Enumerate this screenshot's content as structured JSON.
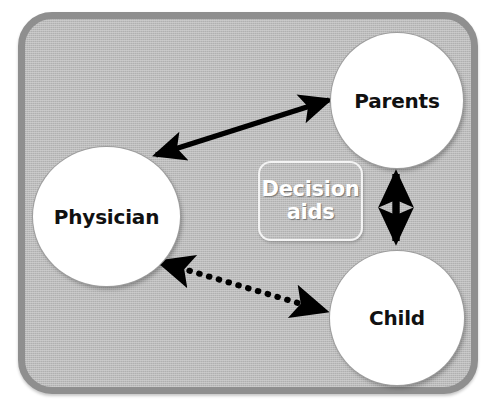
{
  "diagram": {
    "background_color": "#b6b6b6",
    "frame_border_color": "#8f8f8f",
    "node_fill_color": "#ffffff",
    "arrow_color": "#000000",
    "callout_text_color": "#ffffff",
    "scan_artifact_text": "",
    "nodes": [
      {
        "id": "physician",
        "label": "Physician"
      },
      {
        "id": "parents",
        "label": "Parents"
      },
      {
        "id": "child",
        "label": "Child"
      }
    ],
    "callout": {
      "id": "decision-aids",
      "line1": "Decision",
      "line2": "aids"
    },
    "connections": [
      {
        "id": "physician-parents",
        "from": "Physician",
        "to": "Parents",
        "style": "solid",
        "arrowheads": "both"
      },
      {
        "id": "parents-child",
        "from": "Parents",
        "to": "Child",
        "style": "solid",
        "arrowheads": "both"
      },
      {
        "id": "physician-child",
        "from": "Physician",
        "to": "Child",
        "style": "dotted",
        "arrowheads": "both"
      }
    ]
  }
}
